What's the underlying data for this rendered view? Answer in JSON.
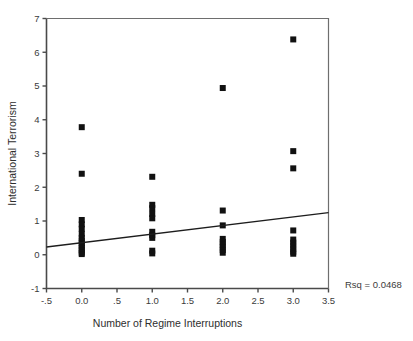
{
  "chart_data": {
    "type": "scatter",
    "title": "",
    "xlabel": "Number of Regime Interruptions",
    "ylabel": "International Terrorism",
    "xlim": [
      -0.5,
      3.5
    ],
    "ylim": [
      -1,
      7
    ],
    "xticks": [
      -0.5,
      0.0,
      0.5,
      1.0,
      1.5,
      2.0,
      2.5,
      3.0,
      3.5
    ],
    "xticklabels": [
      "-.5",
      "0.0",
      ".5",
      "1.0",
      "1.5",
      "2.0",
      "2.5",
      "3.0",
      "3.5"
    ],
    "yticks": [
      -1,
      0,
      1,
      2,
      3,
      4,
      5,
      6,
      7
    ],
    "yticklabels": [
      "-1",
      "0",
      "1",
      "2",
      "3",
      "4",
      "5",
      "6",
      "7"
    ],
    "grid": false,
    "legend": null,
    "annotation": "Rsq = 0.0468",
    "marker": "square",
    "marker_color": "#111111",
    "points": [
      {
        "x": 0.0,
        "y": 3.78
      },
      {
        "x": 0.0,
        "y": 2.4
      },
      {
        "x": 0.0,
        "y": 1.03
      },
      {
        "x": 0.0,
        "y": 0.9
      },
      {
        "x": 0.0,
        "y": 0.77
      },
      {
        "x": 0.0,
        "y": 0.62
      },
      {
        "x": 0.0,
        "y": 0.5
      },
      {
        "x": 0.0,
        "y": 0.42
      },
      {
        "x": 0.0,
        "y": 0.34
      },
      {
        "x": 0.0,
        "y": 0.27
      },
      {
        "x": 0.0,
        "y": 0.2
      },
      {
        "x": 0.0,
        "y": 0.13
      },
      {
        "x": 0.0,
        "y": 0.06
      },
      {
        "x": 0.0,
        "y": 0.02
      },
      {
        "x": 1.0,
        "y": 2.31
      },
      {
        "x": 1.0,
        "y": 1.48
      },
      {
        "x": 1.0,
        "y": 1.38
      },
      {
        "x": 1.0,
        "y": 1.21
      },
      {
        "x": 1.0,
        "y": 1.08
      },
      {
        "x": 1.0,
        "y": 0.68
      },
      {
        "x": 1.0,
        "y": 0.58
      },
      {
        "x": 1.0,
        "y": 0.5
      },
      {
        "x": 1.0,
        "y": 0.12
      },
      {
        "x": 1.0,
        "y": 0.04
      },
      {
        "x": 2.0,
        "y": 4.94
      },
      {
        "x": 2.0,
        "y": 1.31
      },
      {
        "x": 2.0,
        "y": 0.87
      },
      {
        "x": 2.0,
        "y": 0.47
      },
      {
        "x": 2.0,
        "y": 0.38
      },
      {
        "x": 2.0,
        "y": 0.3
      },
      {
        "x": 2.0,
        "y": 0.22
      },
      {
        "x": 2.0,
        "y": 0.14
      },
      {
        "x": 2.0,
        "y": 0.06
      },
      {
        "x": 3.0,
        "y": 6.38
      },
      {
        "x": 3.0,
        "y": 3.07
      },
      {
        "x": 3.0,
        "y": 2.56
      },
      {
        "x": 3.0,
        "y": 0.72
      },
      {
        "x": 3.0,
        "y": 0.45
      },
      {
        "x": 3.0,
        "y": 0.36
      },
      {
        "x": 3.0,
        "y": 0.27
      },
      {
        "x": 3.0,
        "y": 0.18
      },
      {
        "x": 3.0,
        "y": 0.09
      },
      {
        "x": 3.0,
        "y": 0.03
      }
    ],
    "fit_line": {
      "x1": -0.5,
      "y1": 0.23,
      "x2": 3.5,
      "y2": 1.25
    }
  }
}
